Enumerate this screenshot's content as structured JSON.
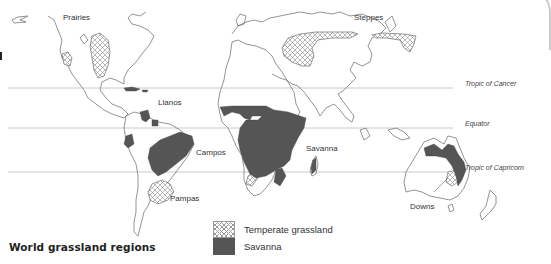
{
  "title": "World grassland regions",
  "reference_lines": [
    {
      "name": "Tropic of Cancer",
      "y": 88
    },
    {
      "name": "Equator",
      "y": 128
    },
    {
      "name": "Tropic of Capricorn",
      "y": 172
    }
  ],
  "region_labels": {
    "prairies": "Prairies",
    "steppes": "Steppes",
    "llanos": "Llanos",
    "campos": "Campos",
    "savanna": "Savanna",
    "pampas": "Pampas",
    "downs": "Downs"
  },
  "legend": {
    "items": [
      {
        "label": "Temperate grassland",
        "pattern": "crosshatch"
      },
      {
        "label": "Savanna",
        "color": "#555555"
      }
    ]
  },
  "colors": {
    "savanna_fill": "#555555",
    "coastline": "#666666",
    "hatch": "#999999",
    "reference_line": "#bbbbbb"
  }
}
